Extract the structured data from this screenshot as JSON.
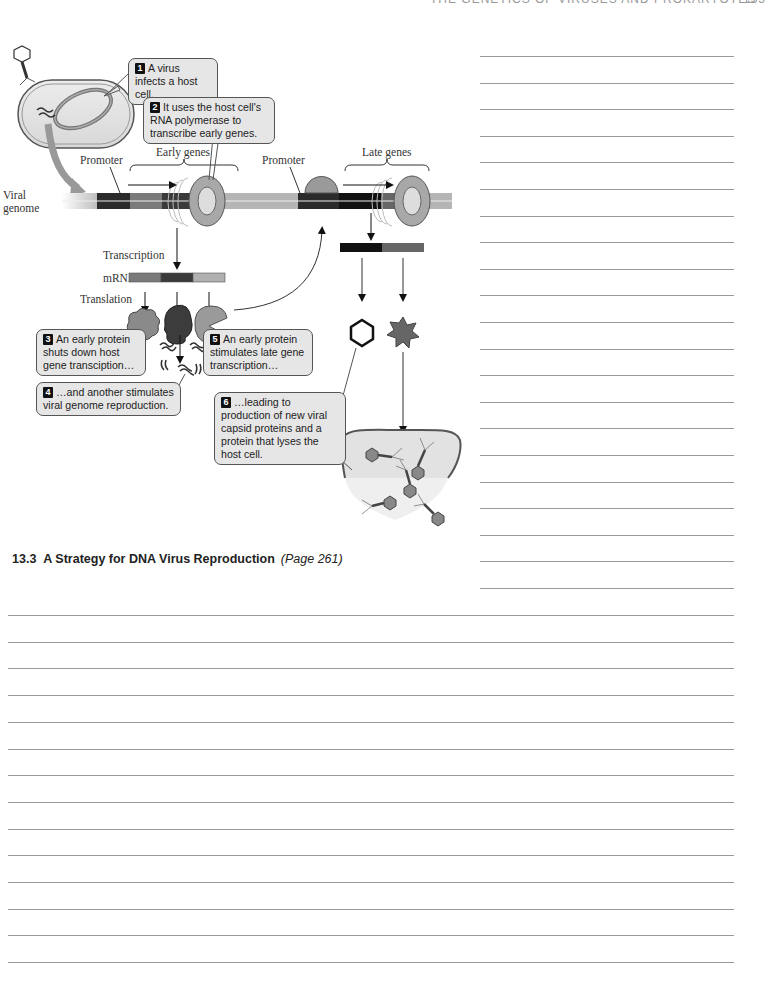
{
  "running_head": {
    "title": "THE GENETICS OF VIRUSES AND PROKARYOTES",
    "page_number": "155"
  },
  "figure": {
    "labels": {
      "promoter_early": "Promoter",
      "early_genes": "Early genes",
      "promoter_late": "Promoter",
      "late_genes": "Late genes",
      "viral": "Viral",
      "genome": "genome",
      "transcription": "Transcription",
      "mrna": "mRNA",
      "translation": "Translation"
    },
    "callouts": [
      {
        "num": "1",
        "text": "A virus infects a host cell."
      },
      {
        "num": "2",
        "text": "It uses the host cell's RNA polymerase to transcribe early genes."
      },
      {
        "num": "3",
        "text": "An early protein shuts down host gene transciption…"
      },
      {
        "num": "4",
        "text": "…and another stimulates viral genome reproduction."
      },
      {
        "num": "5",
        "text": "An early protein stimulates late gene transcription…"
      },
      {
        "num": "6",
        "text": "…leading to production of new viral capsid proteins and a protein that lyses the host cell."
      }
    ],
    "colors": {
      "genome_light": "#b5b5b5",
      "gene_dark": "#2b2b2b",
      "gene_mid": "#6a6a6a",
      "protein_gray": "#8a8a8a",
      "protein_dark": "#3c3c3c",
      "callout_bg": "#e6e6e6"
    }
  },
  "section": {
    "number": "13.3",
    "title": "A Strategy for DNA Virus Reproduction",
    "page_ref": "(Page 261)"
  },
  "answer_lines": {
    "right_column_count": 21,
    "bottom_count": 14
  }
}
